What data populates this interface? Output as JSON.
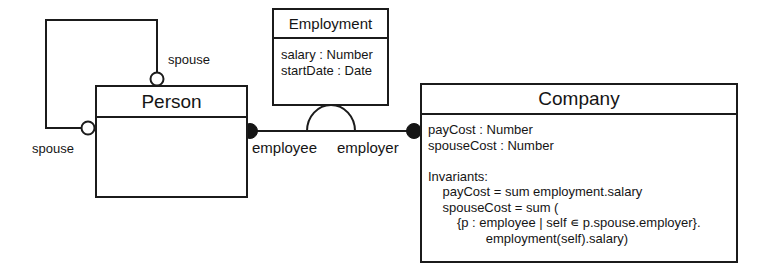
{
  "diagram": {
    "kind": "uml-class-diagram",
    "stroke_color": "#1b1b1b",
    "text_color": "#151515",
    "background_color": "#ffffff"
  },
  "classes": {
    "person": {
      "name": "Person",
      "attributes": ""
    },
    "employment": {
      "name": "Employment",
      "attributes": "salary : Number\nstartDate : Date"
    },
    "company": {
      "name": "Company",
      "attributes": "payCost : Number\nspouseCost : Number\n\nInvariants:\n    payCost = sum employment.salary\n    spouseCost = sum (\n        {p : employee | self ∊ p.spouse.employer}.\n                employment(self).salary)"
    }
  },
  "associations": {
    "spouse_top_role": "spouse",
    "spouse_left_role": "spouse",
    "employee_role": "employee",
    "employer_role": "employer"
  }
}
